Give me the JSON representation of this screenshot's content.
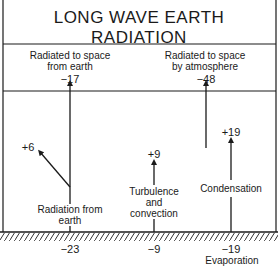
{
  "title": {
    "line1": "LONG WAVE EARTH",
    "line2": "RADIATION"
  },
  "top_flows": [
    {
      "label_line1": "Radiated to space",
      "label_line2": "from earth",
      "value": "−17"
    },
    {
      "label_line1": "Radiated to space",
      "label_line2": "by atmosphere",
      "value": "−48"
    }
  ],
  "atmosphere_flows": [
    {
      "value": "+6"
    },
    {
      "value": "+9"
    },
    {
      "value": "+19"
    }
  ],
  "surface_labels": [
    {
      "line1": "Radiation from",
      "line2": "earth"
    },
    {
      "line1": "Turbulence",
      "line2": "and",
      "line3": "convection"
    },
    {
      "line1": "Condensation"
    }
  ],
  "ground_values": [
    {
      "value": "−23"
    },
    {
      "value": "−9"
    },
    {
      "value": "−19",
      "label": "Evaporation"
    }
  ],
  "colors": {
    "ink": "#1a1a1a",
    "background": "#ffffff"
  }
}
